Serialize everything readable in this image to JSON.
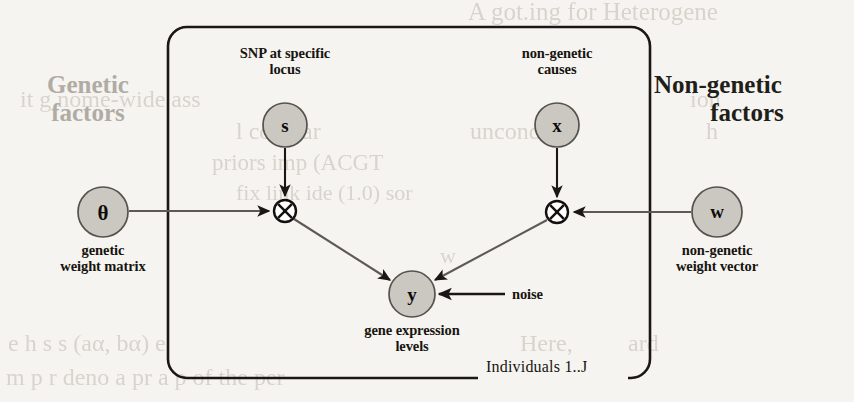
{
  "figure": {
    "type": "probabilistic-graphical-model",
    "plate_label": "Individuals 1..J",
    "side_labels": {
      "left": "Genetic\nfactors",
      "left_line1": "Genetic",
      "left_line2": "factors",
      "left_color": "#b0aca4",
      "right_line1": "Non-genetic",
      "right_line2": "factors",
      "right_color": "#211d18"
    },
    "nodes": [
      {
        "id": "s",
        "symbol": "s",
        "x": 285,
        "y": 125,
        "r": 22,
        "fill": "#cbc8c2",
        "label_line1": "SNP at specific",
        "label_line2": "locus",
        "label_pos": "above"
      },
      {
        "id": "x",
        "symbol": "x",
        "x": 557,
        "y": 125,
        "r": 22,
        "fill": "#cbc8c2",
        "label_line1": "non-genetic",
        "label_line2": "causes",
        "label_pos": "above"
      },
      {
        "id": "theta",
        "symbol": "θ",
        "x": 103,
        "y": 212,
        "r": 25,
        "fill": "#cbc8c2",
        "label_line1": "genetic",
        "label_line2": "weight matrix",
        "label_pos": "below"
      },
      {
        "id": "w",
        "symbol": "w",
        "x": 717,
        "y": 212,
        "r": 25,
        "fill": "#cbc8c2",
        "label_line1": "non-genetic",
        "label_line2": "weight vector",
        "label_pos": "below"
      },
      {
        "id": "y",
        "symbol": "y",
        "x": 412,
        "y": 294,
        "r": 23,
        "fill": "#cbc8c2",
        "label_line1": "gene expression",
        "label_line2": "levels",
        "label_pos": "below"
      }
    ],
    "operators": [
      {
        "id": "mul-genetic",
        "symbol": "⊗",
        "x": 285,
        "y": 211,
        "r": 11
      },
      {
        "id": "mul-nongenetic",
        "symbol": "⊗",
        "x": 557,
        "y": 212,
        "r": 11
      }
    ],
    "noise_label": "noise",
    "edges": [
      {
        "from": "s",
        "to": "mul-genetic"
      },
      {
        "from": "theta",
        "to": "mul-genetic"
      },
      {
        "from": "x",
        "to": "mul-nongenetic"
      },
      {
        "from": "w",
        "to": "mul-nongenetic"
      },
      {
        "from": "mul-genetic",
        "to": "y"
      },
      {
        "from": "mul-nongenetic",
        "to": "y"
      },
      {
        "from": "noise",
        "to": "y"
      }
    ],
    "plate": {
      "x": 168,
      "y": 27,
      "width": 482,
      "height": 351,
      "radius": 18
    },
    "colors": {
      "stroke": "#1a1714",
      "node_fill": "#cbc8c2",
      "node_stroke": "#5d5a55",
      "page_background": "#f6f4f0"
    }
  },
  "bleed_through": [
    {
      "text": "A got.ing for Heterogene",
      "x": 468,
      "y": -2,
      "size": 25
    },
    {
      "text": "it  g nome-wide ass",
      "x": 20,
      "y": 86,
      "size": 24
    },
    {
      "text": "ion",
      "x": 690,
      "y": 86,
      "size": 24
    },
    {
      "text": "l compar",
      "x": 236,
      "y": 118,
      "size": 24
    },
    {
      "text": "h",
      "x": 706,
      "y": 118,
      "size": 24
    },
    {
      "text": "uncond tio",
      "x": 470,
      "y": 118,
      "size": 24
    },
    {
      "text": "priors   imp   (ACGT",
      "x": 212,
      "y": 150,
      "size": 23
    },
    {
      "text": "fix    link   ide  (1.0)   sor",
      "x": 236,
      "y": 180,
      "size": 22
    },
    {
      "text": "w",
      "x": 440,
      "y": 243,
      "size": 22
    },
    {
      "text": "e  h  s  s (aα,  bα) e",
      "x": 8,
      "y": 330,
      "size": 24
    },
    {
      "text": "Here,",
      "x": 520,
      "y": 330,
      "size": 24
    },
    {
      "text": "ard",
      "x": 628,
      "y": 330,
      "size": 24
    },
    {
      "text": "m  p  r  deno   a  pr  a  p of the per",
      "x": 6,
      "y": 364,
      "size": 24
    },
    {
      "text": "θ",
      "x": 594,
      "y": 364,
      "size": 24
    }
  ]
}
